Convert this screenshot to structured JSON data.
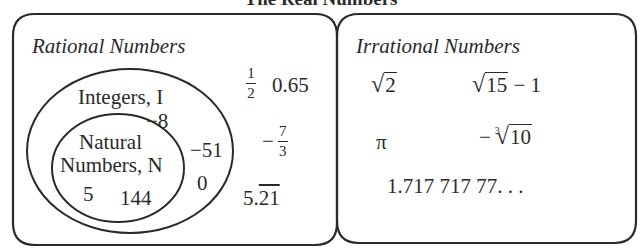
{
  "title": "The Real Numbers",
  "colors": {
    "stroke": "#2a2a2a",
    "background": "#ffffff"
  },
  "rational": {
    "title": "Rational Numbers",
    "integers": {
      "label": "Integers, I",
      "members": [
        "−8",
        "−51",
        "0"
      ],
      "natural": {
        "label_line1": "Natural",
        "label_line2": "Numbers, N",
        "members": [
          "5",
          "144"
        ]
      }
    },
    "other_members": {
      "half_num": "1",
      "half_den": "2",
      "decimal": "0.65",
      "neg_sign": "−",
      "seven_thirds_num": "7",
      "seven_thirds_den": "3",
      "repeating_int": "5.",
      "repeating_part": "21"
    }
  },
  "irrational": {
    "title": "Irrational Numbers",
    "members": {
      "sqrt2_radicand": "2",
      "sqrt15_radicand": "15",
      "sqrt15_suffix": " − 1",
      "pi": "π",
      "cbrt_sign": "−",
      "cbrt_index": "3",
      "cbrt_radicand": "10",
      "decimal": "1.717 717 77. . ."
    }
  }
}
